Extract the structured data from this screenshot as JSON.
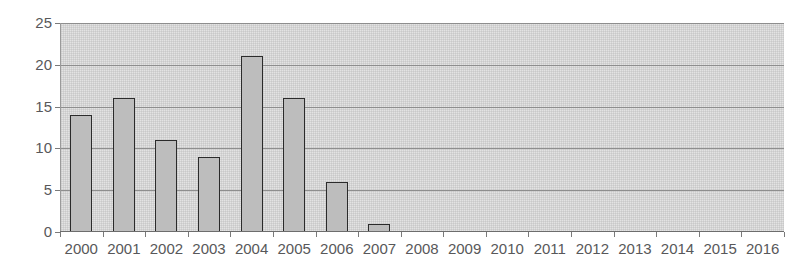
{
  "chart_data": {
    "type": "bar",
    "title": "",
    "subtitle": "",
    "xlabel": "",
    "ylabel": "",
    "categories": [
      "2000",
      "2001",
      "2002",
      "2003",
      "2004",
      "2005",
      "2006",
      "2007",
      "2008",
      "2009",
      "2010",
      "2011",
      "2012",
      "2013",
      "2014",
      "2015",
      "2016"
    ],
    "values": [
      14,
      16,
      11,
      9,
      21,
      16,
      6,
      1,
      0,
      0,
      0,
      0,
      0,
      0,
      0,
      0,
      0
    ],
    "series": [
      {
        "name": "",
        "values": [
          14,
          16,
          11,
          9,
          21,
          16,
          6,
          1,
          0,
          0,
          0,
          0,
          0,
          0,
          0,
          0,
          0
        ]
      }
    ],
    "ylim": [
      0,
      25
    ],
    "ytick_labels": [
      "0",
      "5",
      "10",
      "15",
      "20",
      "25"
    ],
    "ytick_values": [
      0,
      5,
      10,
      15,
      20,
      25
    ],
    "grid": true,
    "legend": false,
    "legend_position": "none",
    "annotations": [],
    "colors": {
      "plot_background": "#d4d4d4",
      "bar_fill": "#bdbdbd",
      "bar_border": "#2b2b2b",
      "gridline": "#8e8e8e",
      "axis_text": "#58585a",
      "page_background": "#ffffff"
    }
  }
}
